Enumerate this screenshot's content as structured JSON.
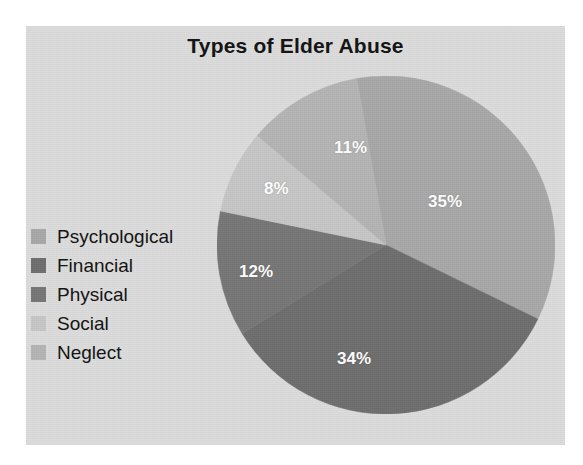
{
  "chart_data": {
    "type": "pie",
    "title": "Types of Elder Abuse",
    "categories": [
      "Psychological",
      "Financial",
      "Physical",
      "Social",
      "Neglect"
    ],
    "values": [
      35,
      34,
      12,
      8,
      11
    ],
    "value_labels": [
      "35%",
      "34%",
      "12%",
      "8%",
      "11%"
    ],
    "colors": [
      "#a8a8a8",
      "#6e6e6e",
      "#767676",
      "#c6c6c6",
      "#b4b4b4"
    ],
    "legend_position": "left",
    "grid": false,
    "xlabel": "",
    "ylabel": "",
    "slices": [
      {
        "label": "Psychological",
        "value": 35,
        "value_label": "35%",
        "color": "#a8a8a8",
        "start_angle": 0,
        "end_angle": 126
      },
      {
        "label": "Financial",
        "value": 34,
        "value_label": "34%",
        "color": "#6e6e6e",
        "start_angle": 126,
        "end_angle": 248.4
      },
      {
        "label": "Physical",
        "value": 12,
        "value_label": "12%",
        "color": "#767676",
        "start_angle": 248.4,
        "end_angle": 291.6
      },
      {
        "label": "Social",
        "value": 8,
        "value_label": "8%",
        "color": "#c6c6c6",
        "start_angle": 291.6,
        "end_angle": 320.4
      },
      {
        "label": "Neglect",
        "value": 11,
        "value_label": "11%",
        "color": "#b4b4b4",
        "start_angle": 320.4,
        "end_angle": 360
      }
    ]
  },
  "chart": {
    "title": "Types of Elder Abuse",
    "background": "#dcdcdc",
    "label_color": "#ffffff",
    "title_color": "#121212"
  },
  "legend": {
    "items": [
      {
        "label": "Psychological",
        "color": "#a8a8a8"
      },
      {
        "label": "Financial",
        "color": "#6e6e6e"
      },
      {
        "label": "Physical",
        "color": "#767676"
      },
      {
        "label": "Social",
        "color": "#c6c6c6"
      },
      {
        "label": "Neglect",
        "color": "#b4b4b4"
      }
    ]
  },
  "labels": {
    "p35": "35%",
    "p34": "34%",
    "p12": "12%",
    "p8": "8%",
    "p11": "11%"
  }
}
